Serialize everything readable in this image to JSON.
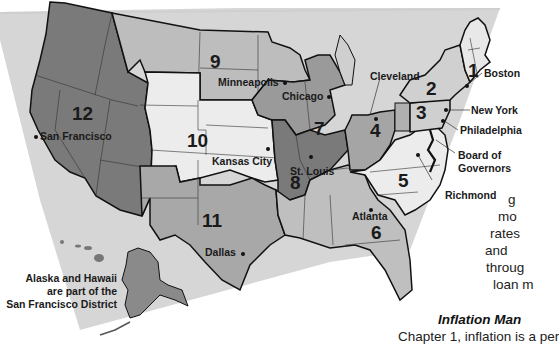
{
  "map": {
    "title": "Federal Reserve Districts",
    "colors": {
      "background_panel": "#d4d4d4",
      "district_dark": "#7a7a7a",
      "district_mid": "#a8a8a8",
      "district_light": "#cfcfcf",
      "district_white": "#eeeeee",
      "border": "#111111"
    },
    "districts": [
      {
        "number": "1",
        "city": "Boston"
      },
      {
        "number": "2",
        "city": "New York"
      },
      {
        "number": "3",
        "city": "Philadelphia"
      },
      {
        "number": "4",
        "city": "Cleveland"
      },
      {
        "number": "5",
        "city": "Richmond"
      },
      {
        "number": "6",
        "city": "Atlanta"
      },
      {
        "number": "7",
        "city": "Chicago"
      },
      {
        "number": "8",
        "city": "St. Louis"
      },
      {
        "number": "9",
        "city": "Minneapolis"
      },
      {
        "number": "10",
        "city": "Kansas City"
      },
      {
        "number": "11",
        "city": "Dallas"
      },
      {
        "number": "12",
        "city": "San Francisco"
      }
    ],
    "board_label_line1": "Board of",
    "board_label_line2": "Governors",
    "note_line1": "Alaska and Hawaii",
    "note_line2": "are part of the",
    "note_line3": "San Francisco District"
  },
  "page_text": {
    "fragments": [
      "g",
      "mo",
      "rates",
      "and",
      "throug",
      "loan m"
    ],
    "heading": "Inflation Man",
    "last_line_partial": "Chapter 1, inflation is a per"
  }
}
